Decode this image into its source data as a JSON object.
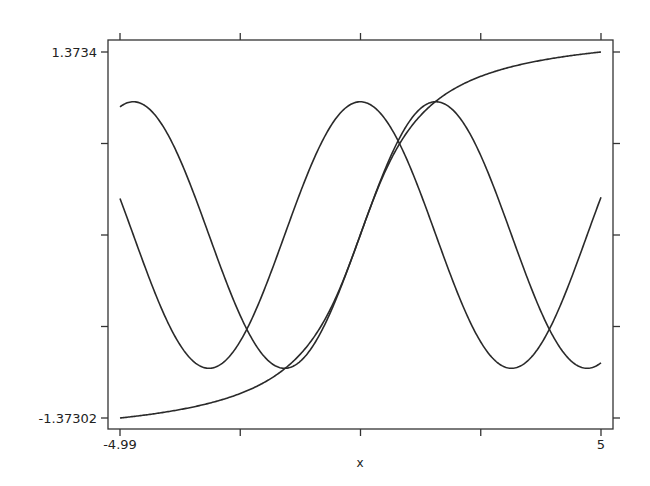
{
  "chart_data": {
    "type": "line",
    "title": "",
    "xlabel": "x",
    "ylabel": "",
    "xlim": [
      -4.99,
      5
    ],
    "ylim": [
      -1.37302,
      1.3734
    ],
    "x_tick_labels": [
      "-4.99",
      "5"
    ],
    "y_tick_labels": [
      "1.3734",
      "-1.37302"
    ],
    "grid": false,
    "legend": null,
    "series": [
      {
        "name": "sin(x)",
        "function": "sin",
        "start": 0.9614,
        "end": -0.9589,
        "max": 1.0,
        "min": -1.0
      },
      {
        "name": "cos(x)",
        "function": "cos",
        "start": 0.274,
        "end": 0.2837,
        "max": 1.0,
        "min": -1.0
      },
      {
        "name": "atan(x)",
        "function": "atan",
        "start": -1.37302,
        "end": 1.3734
      }
    ],
    "sample_points": {
      "x": [
        -4.99,
        -4,
        -3,
        -2,
        -1,
        0,
        1,
        2,
        3,
        4,
        5
      ],
      "sin": [
        0.961,
        0.757,
        -0.141,
        -0.909,
        -0.841,
        0.0,
        0.841,
        0.909,
        0.141,
        -0.757,
        -0.959
      ],
      "cos": [
        0.274,
        -0.654,
        -0.99,
        -0.416,
        0.54,
        1.0,
        0.54,
        -0.416,
        -0.99,
        -0.654,
        0.284
      ],
      "atan": [
        -1.373,
        -1.326,
        -1.249,
        -1.107,
        -0.785,
        0.0,
        0.785,
        1.107,
        1.249,
        1.326,
        1.373
      ]
    }
  },
  "axes": {
    "x_label": "x",
    "x_min_label": "-4.99",
    "x_max_label": "5",
    "y_max_label": "1.3734",
    "y_min_label": "-1.37302"
  },
  "colors": {
    "line": "#2a2a2a",
    "frame": "#333333",
    "background": "#ffffff"
  }
}
